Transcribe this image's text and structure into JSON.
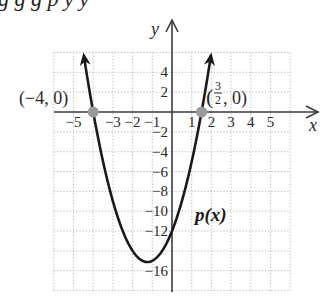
{
  "top_text_cropped": "g g g p y y",
  "chart_data": {
    "type": "line",
    "title": "",
    "function_label": "p(x)",
    "function_expression": "p(x) = 2x^2 + 5x - 12",
    "coefficients": {
      "a": 2,
      "b": 5,
      "c": -12
    },
    "domain_drawn": [
      -4.5,
      2
    ],
    "xlabel": "x",
    "ylabel": "y",
    "xlim": [
      -6,
      6
    ],
    "ylim": [
      -18,
      6
    ],
    "grid": true,
    "grid_style": "dotted",
    "x_ticks": [
      -5,
      -3,
      -2,
      -1,
      1,
      2,
      3,
      4,
      5
    ],
    "x_tick_labels": [
      "−5",
      "−3",
      "−2",
      "−1",
      "1",
      "2",
      "3",
      "4",
      "5"
    ],
    "y_ticks": [
      4,
      2,
      -2,
      -4,
      -6,
      -8,
      -10,
      -12,
      -16
    ],
    "y_tick_labels": [
      "4",
      "2",
      "−2",
      "−4",
      "−6",
      "−8",
      "−10",
      "−12",
      "−16"
    ],
    "points": [
      {
        "x": -4,
        "y": 0,
        "label": "(−4, 0)"
      },
      {
        "x": 1.5,
        "y": 0,
        "label": "(3/2, 0)"
      }
    ],
    "vertex": {
      "x": -1.25,
      "y": -15.125
    },
    "y_intercept": -12,
    "colors": {
      "curve": "#1a1a1a",
      "axis": "#3a3a3a",
      "grid": "#b8b8b8",
      "point": "#9a9a9a"
    }
  },
  "labels": {
    "y_axis": "y",
    "x_axis": "x",
    "function": "p(x)",
    "point_left": "(−4, 0)",
    "point_right_open": "(",
    "point_right_num": "3",
    "point_right_den": "2",
    "point_right_close": ", 0)"
  }
}
